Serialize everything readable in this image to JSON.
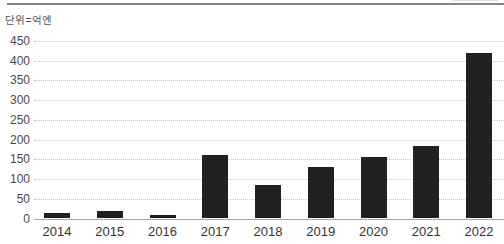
{
  "unit_label": "단위=억엔",
  "colors": {
    "bar": "#212121",
    "gridline": "#c6c6c6",
    "axis_line": "#a8a8a8",
    "tick_text": "#4a4a4a",
    "top_rule": "#858585"
  },
  "chart_data": {
    "type": "bar",
    "title": "",
    "xlabel": "",
    "ylabel": "단위=억엔",
    "categories": [
      "2014",
      "2015",
      "2016",
      "2017",
      "2018",
      "2019",
      "2020",
      "2021",
      "2022"
    ],
    "values": [
      15,
      20,
      10,
      160,
      85,
      130,
      155,
      185,
      420
    ],
    "ylim": [
      0,
      450
    ],
    "yticks": [
      0,
      50,
      100,
      150,
      200,
      250,
      300,
      350,
      400,
      450
    ],
    "grid": true,
    "legend": false
  }
}
